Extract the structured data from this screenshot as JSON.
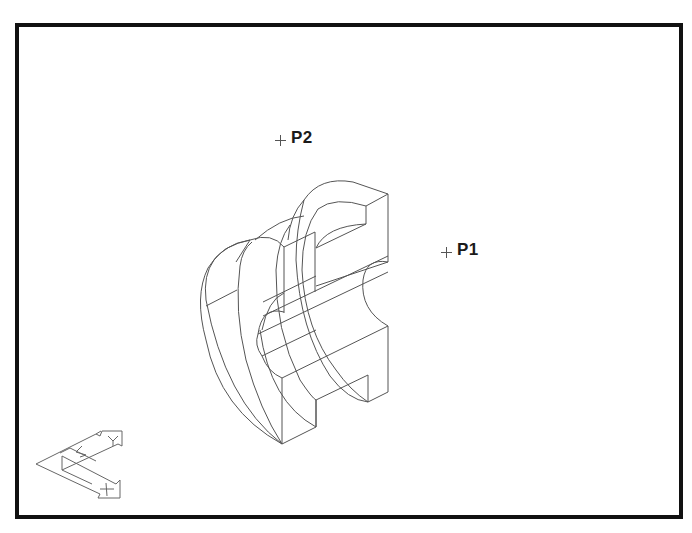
{
  "viewport": {
    "background": "#ffffff",
    "frame_color": "#111111",
    "line_color": "#555555"
  },
  "points": [
    {
      "id": "P2",
      "label": "P2",
      "x": 280,
      "y": 140
    },
    {
      "id": "P1",
      "label": "P1",
      "x": 446,
      "y": 252
    }
  ],
  "model": {
    "description": "Isometric wireframe of a C-shaped half-ring flange part with rectangular slot",
    "view": "isometric"
  },
  "triad": {
    "axes": [
      "X",
      "Y",
      "Z"
    ],
    "labels": {
      "x_axis": "X",
      "y_axis": "Y",
      "z_axis": "Z"
    }
  }
}
